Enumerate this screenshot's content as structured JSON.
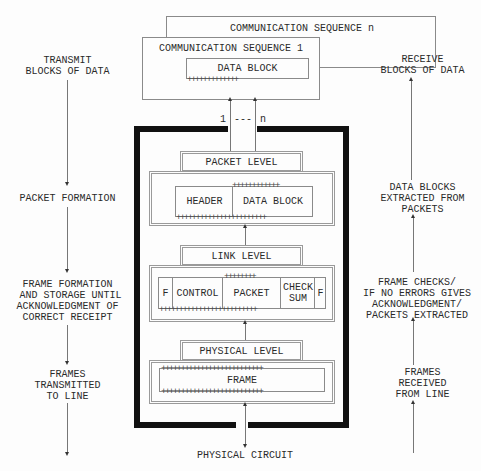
{
  "top": {
    "seq_n_label": "COMMUNICATION SEQUENCE n",
    "seq_1_label": "COMMUNICATION SEQUENCE 1",
    "data_block_label": "DATA BLOCK",
    "plus_row_short": "+++++++++++++",
    "link_left_label": "1",
    "link_dash_label": "---",
    "link_right_label": "n"
  },
  "left_column": {
    "items": [
      {
        "label": "TRANSMIT\nBLOCKS OF DATA"
      },
      {
        "label": "PACKET FORMATION"
      },
      {
        "label": "FRAME FORMATION\n AND STORAGE UNTIL\nACKNOWLEDGMENT OF\nCORRECT RECEIPT"
      },
      {
        "label": "FRAMES\nTRANSMITTED\nTO LINE"
      }
    ]
  },
  "right_column": {
    "items": [
      {
        "label": "RECEIVE\nBLOCKS OF DATA"
      },
      {
        "label": "DATA BLOCKS\nEXTRACTED FROM\nPACKETS"
      },
      {
        "label": "FRAME CHECKS/\nIF NO ERRORS GIVES\nACKNOWLEDGMENT/\nPACKETS EXTRACTED"
      },
      {
        "label": "FRAMES\nRECEIVED\nFROM LINE"
      }
    ]
  },
  "layers": {
    "packet": {
      "title": "PACKET LEVEL",
      "header": "HEADER",
      "data_block": "DATA BLOCK",
      "plus_top": "++++++++++++",
      "plus_bottom": "+++++++++++++++++++++++"
    },
    "link": {
      "title": "LINK LEVEL",
      "flag_left": "F",
      "control": "CONTROL",
      "packet": "PACKET",
      "checksum": "CHECK\nSUM",
      "flag_right": "F",
      "plus_top": "++++++++",
      "plus_bottom": "+++++++++++++++++++++++++"
    },
    "physical": {
      "title": "PHYSICAL LEVEL",
      "frame": "FRAME",
      "plus_top": "++++++++++++++++++++++++++",
      "plus_bottom": "++++++++++++++++++++++++++"
    }
  },
  "bottom": {
    "physical_circuit_label": "PHYSICAL CIRCUIT"
  },
  "colors": {
    "frame_border": "#111111",
    "box_border": "#8a8a8a",
    "text": "#2a2a2a"
  }
}
